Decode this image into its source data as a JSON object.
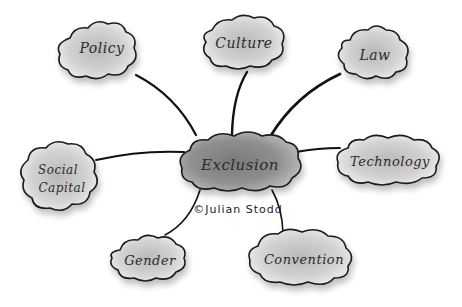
{
  "diagram": {
    "type": "mind-map",
    "center": {
      "label": "Exclusion"
    },
    "credit": "©Julian Stodd",
    "nodes": [
      {
        "id": "policy",
        "label": "Policy"
      },
      {
        "id": "culture",
        "label": "Culture"
      },
      {
        "id": "law",
        "label": "Law"
      },
      {
        "id": "technology",
        "label": "Technology"
      },
      {
        "id": "convention",
        "label": "Convention"
      },
      {
        "id": "gender",
        "label": "Gender"
      },
      {
        "id": "social-capital",
        "label_line1": "Social",
        "label_line2": "Capital"
      }
    ],
    "colors": {
      "background": "#ffffff",
      "ink": "#1a1a1a",
      "cloud_light": "#cfcfcf",
      "cloud_dark": "#8a8a8a"
    }
  }
}
